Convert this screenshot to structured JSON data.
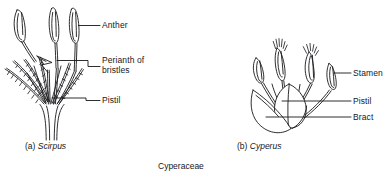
{
  "figure": {
    "plate_caption": "Cyperaceae",
    "ink_color": "#17171a",
    "background_color": "#ffffff",
    "width": 385,
    "height": 178
  },
  "panels": [
    {
      "id": "a",
      "marker": "(a)",
      "species": "Scirpus",
      "caption_prefix": "(a)",
      "caption_species": "Scirpus",
      "labels": [
        {
          "name": "anther",
          "text": "Anther",
          "line1": "Anther",
          "line2": ""
        },
        {
          "name": "perianth-of-bristles",
          "text": "Perianth of bristles",
          "line1": "Perianth of",
          "line2": "bristles"
        },
        {
          "name": "pistil",
          "text": "Pistil",
          "line1": "Pistil",
          "line2": ""
        }
      ]
    },
    {
      "id": "b",
      "marker": "(b)",
      "species": "Cyperus",
      "caption_prefix": "(b)",
      "caption_species": "Cyperus",
      "labels": [
        {
          "name": "stamen",
          "text": "Stamen",
          "line1": "Stamen",
          "line2": ""
        },
        {
          "name": "pistil",
          "text": "Pistil",
          "line1": "Pistil",
          "line2": ""
        },
        {
          "name": "bract",
          "text": "Bract",
          "line1": "Bract",
          "line2": ""
        }
      ]
    }
  ]
}
